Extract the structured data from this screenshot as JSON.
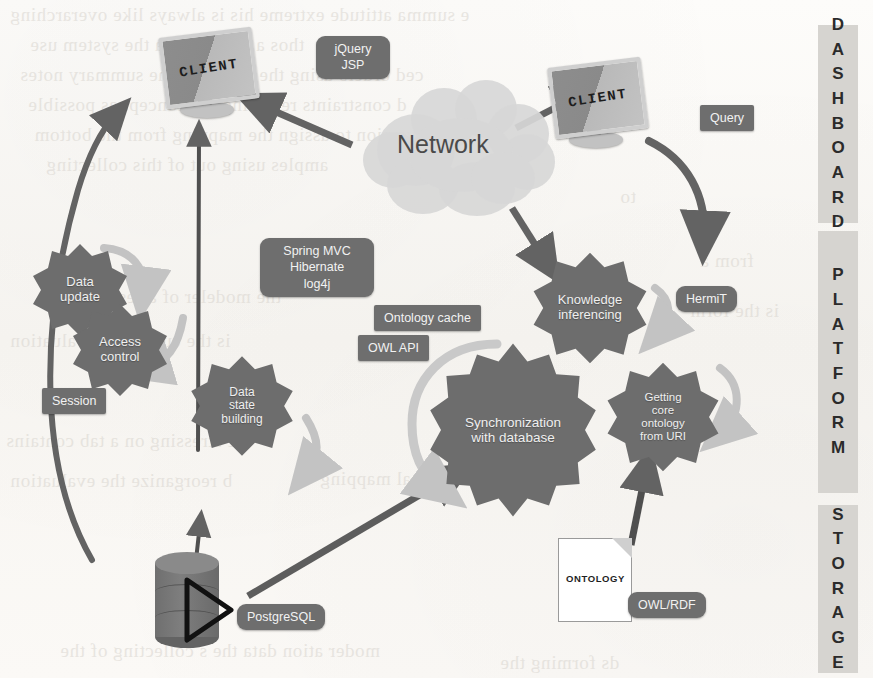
{
  "diagram": {
    "layers": [
      {
        "id": "dashboard",
        "label": "DASHBOARD"
      },
      {
        "id": "platform",
        "label": "PLATFORM"
      },
      {
        "id": "storage",
        "label": "STORAGE"
      }
    ],
    "nodes": {
      "client_left": {
        "label": "CLIENT",
        "type": "monitor"
      },
      "client_right": {
        "label": "CLIENT",
        "type": "monitor"
      },
      "network": {
        "label": "Network",
        "type": "cloud"
      },
      "ontology_doc": {
        "label": "ONTOLOGY",
        "type": "document"
      },
      "database": {
        "label": "",
        "type": "cylinder"
      }
    },
    "gears": [
      {
        "id": "data-update",
        "lines": [
          "Data",
          "update"
        ],
        "font": 13
      },
      {
        "id": "access-control",
        "lines": [
          "Access",
          "control"
        ],
        "font": 13
      },
      {
        "id": "data-state-building",
        "lines": [
          "Data",
          "state",
          "building"
        ],
        "font": 12
      },
      {
        "id": "knowledge-inferencing",
        "lines": [
          "Knowledge",
          "inferencing"
        ],
        "font": 13
      },
      {
        "id": "synchronization",
        "lines": [
          "Synchronization",
          "with database"
        ],
        "font": 13.5
      },
      {
        "id": "getting-core-ontology",
        "lines": [
          "Getting",
          "core",
          "ontology",
          "from URI"
        ],
        "font": 11.5
      }
    ],
    "tags": [
      {
        "id": "jquery-jsp",
        "lines": [
          "jQuery",
          "JSP"
        ],
        "shape": "round"
      },
      {
        "id": "query",
        "lines": [
          "Query"
        ],
        "shape": "sq"
      },
      {
        "id": "spring-stack",
        "lines": [
          "Spring MVC",
          "Hibernate",
          "log4j"
        ],
        "shape": "round"
      },
      {
        "id": "ontology-cache",
        "lines": [
          "Ontology cache"
        ],
        "shape": "sq"
      },
      {
        "id": "owl-api",
        "lines": [
          "OWL API"
        ],
        "shape": "sq"
      },
      {
        "id": "hermit",
        "lines": [
          "HermiT"
        ],
        "shape": "round"
      },
      {
        "id": "session",
        "lines": [
          "Session"
        ],
        "shape": "sq"
      },
      {
        "id": "postgresql",
        "lines": [
          "PostgreSQL"
        ],
        "shape": "round"
      },
      {
        "id": "owl-rdf",
        "lines": [
          "OWL/RDF"
        ],
        "shape": "round"
      }
    ],
    "colors": {
      "gear_fill": "#6d6d6d",
      "tag_fill": "#6e6e6e",
      "tag_text": "#f2f2f2",
      "arrow_dark": "#636363",
      "arrow_light": "#c3c3c3",
      "band_fill": "#d6d4d0",
      "band_text": "#2b2b2b",
      "cloud_fill": "#d7d7d7",
      "cloud_text": "#4a4a4a",
      "page_bg": "#fbfaf8"
    }
  },
  "labels": {
    "client_left": "CLIENT",
    "client_right": "CLIENT",
    "network": "Network",
    "ontology_doc": "ONTOLOGY"
  },
  "bleed_text": [
    "a signing attitude is always like overarching",
    "those in use to data the system",
    "ced orders using the text of the summary notes",
    "d constraints requiring the concept as possible",
    "version to assign the mapping from the bottom"
  ]
}
